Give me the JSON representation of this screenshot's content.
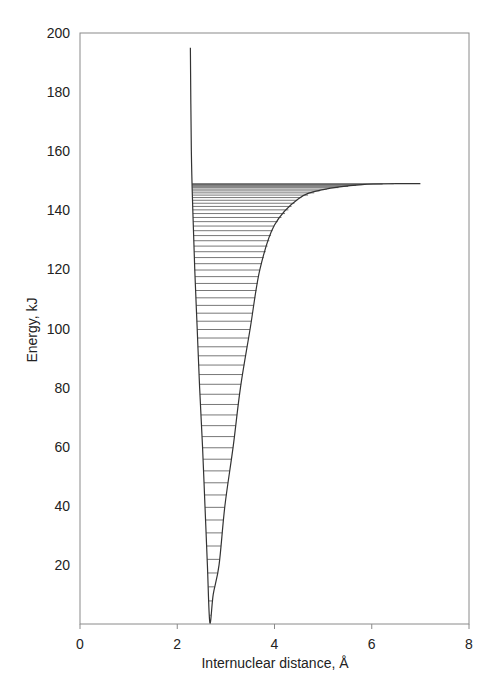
{
  "chart_data": {
    "type": "line",
    "title": "",
    "xlabel": "Internuclear distance, Å",
    "ylabel": "Energy, kJ",
    "xlim": [
      0,
      8
    ],
    "ylim": [
      0,
      200
    ],
    "x_ticks": [
      "0",
      "2",
      "4",
      "6",
      "8"
    ],
    "y_ticks": [
      "20",
      "40",
      "60",
      "80",
      "100",
      "120",
      "140",
      "160",
      "180",
      "200"
    ],
    "grid": false,
    "legend": null,
    "series": [
      {
        "name": "Potential energy curve",
        "description": "Anharmonic (Morse-type) potential well with minimum near 2.67 Å, dissociation energy ~149 kJ",
        "points": [
          [
            2.27,
            195
          ],
          [
            2.29,
            160
          ],
          [
            2.32,
            140
          ],
          [
            2.36,
            120
          ],
          [
            2.41,
            100
          ],
          [
            2.46,
            80
          ],
          [
            2.52,
            60
          ],
          [
            2.57,
            40
          ],
          [
            2.62,
            20
          ],
          [
            2.67,
            0.5
          ],
          [
            2.74,
            10
          ],
          [
            2.86,
            20
          ],
          [
            2.98,
            40
          ],
          [
            3.15,
            60
          ],
          [
            3.3,
            80
          ],
          [
            3.5,
            100
          ],
          [
            3.7,
            120
          ],
          [
            4.0,
            135
          ],
          [
            4.5,
            144
          ],
          [
            5.0,
            147
          ],
          [
            5.8,
            148.7
          ],
          [
            6.5,
            149
          ],
          [
            7.0,
            149
          ]
        ]
      }
    ],
    "annotations": "Horizontal vibrational energy levels fill the well from ~1 kJ up to ~149 kJ, spacing decreasing toward the dissociation limit",
    "vib_levels": {
      "count": 60,
      "dissociation_energy": 149,
      "r_min": 2.67,
      "e_min": 0.5
    }
  }
}
